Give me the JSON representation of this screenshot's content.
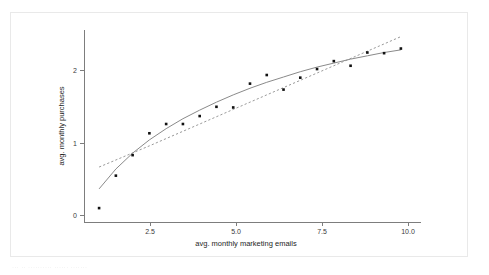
{
  "figure": {
    "background_color": "#ffffff",
    "card_border_color": "#e9e9e9",
    "caption_text": "··· ·· ·········· ······ ·······"
  },
  "chart_data": {
    "type": "scatter",
    "title": "",
    "xlabel": "avg. monthly marketing emails",
    "ylabel": "avg. monthly purchases",
    "xlim": [
      0.55,
      10.6
    ],
    "ylim": [
      -0.28,
      2.62
    ],
    "xticks": [
      2.5,
      5.0,
      7.5,
      10.0
    ],
    "xticklabels": [
      "2.5",
      "5.0",
      "7.5",
      "10.0"
    ],
    "yticks": [
      0,
      1,
      2
    ],
    "yticklabels": [
      "0",
      "1",
      "2"
    ],
    "grid": false,
    "legend": "none",
    "points": [
      {
        "x": 1.0,
        "y": -0.07
      },
      {
        "x": 1.5,
        "y": 0.42
      },
      {
        "x": 2.0,
        "y": 0.73
      },
      {
        "x": 2.5,
        "y": 1.06
      },
      {
        "x": 3.0,
        "y": 1.2
      },
      {
        "x": 3.5,
        "y": 1.2
      },
      {
        "x": 4.0,
        "y": 1.32
      },
      {
        "x": 4.5,
        "y": 1.46
      },
      {
        "x": 5.0,
        "y": 1.45
      },
      {
        "x": 5.5,
        "y": 1.81
      },
      {
        "x": 6.0,
        "y": 1.94
      },
      {
        "x": 6.5,
        "y": 1.72
      },
      {
        "x": 7.0,
        "y": 1.9
      },
      {
        "x": 7.5,
        "y": 2.03
      },
      {
        "x": 8.0,
        "y": 2.15
      },
      {
        "x": 8.5,
        "y": 2.08
      },
      {
        "x": 9.0,
        "y": 2.28
      },
      {
        "x": 9.5,
        "y": 2.27
      },
      {
        "x": 10.0,
        "y": 2.34
      }
    ],
    "series": [
      {
        "name": "logarithmic-fit",
        "style": "solid",
        "color": "#8a8a8a",
        "x": [
          1.0,
          1.5,
          2.0,
          2.5,
          3.0,
          3.5,
          4.0,
          4.5,
          5.0,
          5.5,
          6.0,
          6.5,
          7.0,
          7.5,
          8.0,
          8.5,
          9.0,
          9.5,
          10.0
        ],
        "y": [
          0.22,
          0.52,
          0.76,
          0.96,
          1.13,
          1.28,
          1.41,
          1.53,
          1.64,
          1.74,
          1.83,
          1.91,
          1.99,
          2.06,
          2.12,
          2.18,
          2.23,
          2.28,
          2.32
        ]
      },
      {
        "name": "linear-fit",
        "style": "dashed",
        "color": "#9a9a9a",
        "x": [
          1.0,
          2.5,
          5.0,
          7.5,
          10.0
        ],
        "y": [
          0.55,
          0.87,
          1.42,
          1.97,
          2.52
        ]
      }
    ]
  }
}
